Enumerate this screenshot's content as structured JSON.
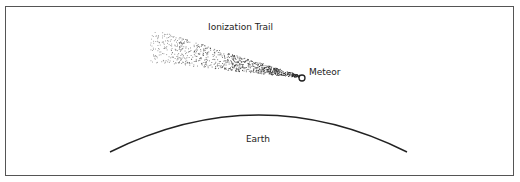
{
  "diagram": {
    "type": "illustration",
    "title": "",
    "labels": {
      "trail": "Ionization Trail",
      "meteor": "Meteor",
      "earth": "Earth"
    },
    "colors": {
      "border": "#555555",
      "ink": "#222222",
      "background": "#ffffff"
    },
    "elements": {
      "meteor": {
        "cx": 302,
        "cy": 78,
        "r": 3
      },
      "earth_arc": {
        "x1": 110,
        "y1": 152,
        "cx": 259,
        "cy": 78,
        "x2": 407,
        "y2": 152
      },
      "trail": {
        "tip_x": 299,
        "tip_y": 76,
        "tail_x": 150,
        "tail_y": 45,
        "tail_half_width": 16,
        "dot_count": 900
      }
    }
  }
}
